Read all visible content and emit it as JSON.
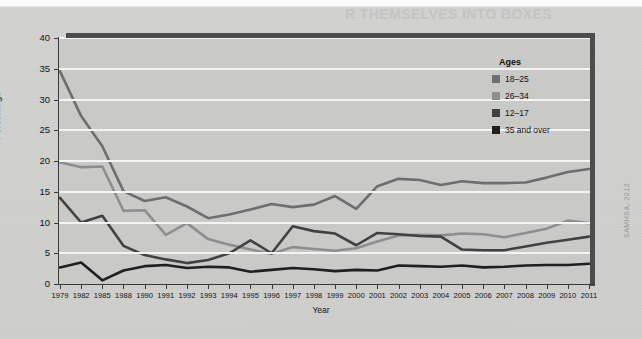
{
  "figure": {
    "background_color": "#cfcfcd",
    "plot_background_color": "#c9c9c7",
    "gridline_color": "#f4f4f2",
    "frame_color": "#4c4c4c",
    "source_credit": "SAMHSA, 2012",
    "bleed_through_top": "R THEMSELVES INTO BOXES",
    "bleed_through_body": "and carry it around with them, and they worry about what happens if the box breaks. They worry about losing it and they worry about what other people think about the box."
  },
  "chart_data": {
    "type": "line",
    "title": "",
    "xlabel": "Year",
    "ylabel": "Percentage",
    "ylim": [
      0,
      40
    ],
    "ytick_values": [
      0,
      5,
      10,
      15,
      20,
      25,
      30,
      35,
      40
    ],
    "ytick_labels": [
      "0",
      "5",
      "10",
      "15",
      "20",
      "25",
      "30",
      "35",
      "40"
    ],
    "grid": true,
    "grid_axis": "y",
    "legend_title": "Ages",
    "legend_position": "upper right inside",
    "categories": [
      "1979",
      "1982",
      "1985",
      "1988",
      "1990",
      "1991",
      "1992",
      "1993",
      "1994",
      "1995",
      "1996",
      "1997",
      "1998",
      "1999",
      "2000",
      "2001",
      "2002",
      "2003",
      "2004",
      "2005",
      "2006",
      "2007",
      "2008",
      "2009",
      "2010",
      "2011"
    ],
    "series": [
      {
        "name": "18–25",
        "color": "#6e6e6e",
        "values": [
          34.6,
          27.3,
          22.4,
          15.1,
          13.5,
          14.1,
          12.6,
          10.7,
          11.3,
          12.1,
          13.0,
          12.5,
          12.9,
          14.3,
          12.2,
          15.9,
          17.1,
          16.9,
          16.1,
          16.7,
          16.4,
          16.4,
          16.5,
          17.3,
          18.2,
          18.7
        ]
      },
      {
        "name": "26–34",
        "color": "#8e8e8e",
        "values": [
          19.8,
          19.0,
          19.1,
          11.9,
          12.0,
          8.0,
          9.9,
          7.3,
          6.4,
          5.6,
          4.9,
          6.0,
          5.7,
          5.4,
          5.8,
          6.9,
          7.9,
          8.0,
          7.9,
          8.2,
          8.1,
          7.6,
          8.3,
          9.0,
          10.3,
          9.9
        ]
      },
      {
        "name": "12–17",
        "color": "#414141",
        "values": [
          14.0,
          10.0,
          11.1,
          6.2,
          4.7,
          4.0,
          3.4,
          3.9,
          5.0,
          7.1,
          5.0,
          9.4,
          8.6,
          8.2,
          6.3,
          8.3,
          8.1,
          7.8,
          7.7,
          5.6,
          5.5,
          5.5,
          6.1,
          6.7,
          7.2,
          7.7
        ]
      },
      {
        "name": "35 and over",
        "color": "#1f1f1f",
        "values": [
          2.7,
          3.5,
          0.6,
          2.2,
          2.9,
          3.1,
          2.6,
          2.8,
          2.7,
          2.0,
          2.3,
          2.6,
          2.4,
          2.1,
          2.3,
          2.2,
          3.0,
          2.9,
          2.8,
          3.0,
          2.7,
          2.8,
          3.0,
          3.1,
          3.1,
          3.3
        ]
      }
    ]
  },
  "legend": {
    "title": "Ages",
    "items": [
      {
        "label": "18–25",
        "color": "#6e6e6e"
      },
      {
        "label": "26–34",
        "color": "#8e8e8e"
      },
      {
        "label": "12–17",
        "color": "#414141"
      },
      {
        "label": "35 and over",
        "color": "#1f1f1f"
      }
    ]
  }
}
